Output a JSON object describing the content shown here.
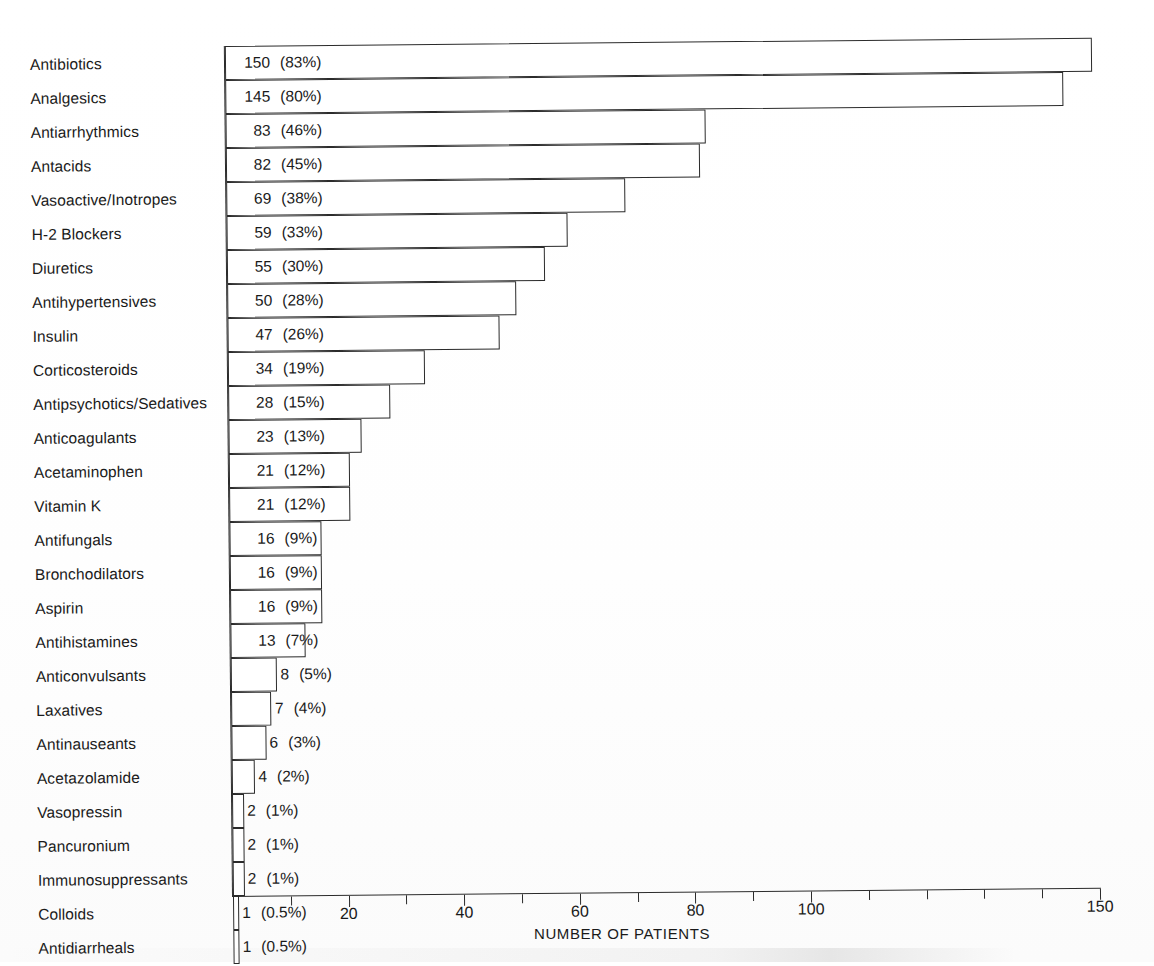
{
  "chart_data": {
    "type": "bar",
    "orientation": "horizontal",
    "title": "",
    "xlabel": "NUMBER OF PATIENTS",
    "ylabel": "",
    "xlim": [
      0,
      150
    ],
    "grid": false,
    "legend": null,
    "total_patients": 181,
    "xticks": [
      {
        "value": 20,
        "label": "20"
      },
      {
        "value": 40,
        "label": "40"
      },
      {
        "value": 60,
        "label": "60"
      },
      {
        "value": 80,
        "label": "80"
      },
      {
        "value": 100,
        "label": "100"
      },
      {
        "value": 150,
        "label": "150"
      }
    ],
    "minor_tick_interval": 10,
    "categories": [
      "Antibiotics",
      "Analgesics",
      "Antiarrhythmics",
      "Antacids",
      "Vasoactive/Inotropes",
      "H-2 Blockers",
      "Diuretics",
      "Antihypertensives",
      "Insulin",
      "Corticosteroids",
      "Antipsychotics/Sedatives",
      "Anticoagulants",
      "Acetaminophen",
      "Vitamin K",
      "Antifungals",
      "Bronchodilators",
      "Aspirin",
      "Antihistamines",
      "Anticonvulsants",
      "Laxatives",
      "Antinauseants",
      "Acetazolamide",
      "Vasopressin",
      "Pancuronium",
      "Immunosuppressants",
      "Colloids",
      "Antidiarrheals"
    ],
    "values": [
      150,
      145,
      83,
      82,
      69,
      59,
      55,
      50,
      47,
      34,
      28,
      23,
      21,
      21,
      16,
      16,
      16,
      13,
      8,
      7,
      6,
      4,
      2,
      2,
      2,
      1,
      1
    ],
    "percent_labels": [
      "(83%)",
      "(80%)",
      "(46%)",
      "(45%)",
      "(38%)",
      "(33%)",
      "(30%)",
      "(28%)",
      "(26%)",
      "(19%)",
      "(15%)",
      "(13%)",
      "(12%)",
      "(12%)",
      "(9%)",
      "(9%)",
      "(9%)",
      "(7%)",
      "(5%)",
      "(4%)",
      "(3%)",
      "(2%)",
      "(1%)",
      "(1%)",
      "(1%)",
      "(0.5%)",
      "(0.5%)"
    ],
    "value_labels": [
      "150",
      "145",
      "83",
      "82",
      "69",
      "59",
      "55",
      "50",
      "47",
      "34",
      "28",
      "23",
      "21",
      "21",
      "16",
      "16",
      "16",
      "13",
      "8",
      "7",
      "6",
      "4",
      "2",
      "2",
      "2",
      "1",
      "1"
    ],
    "colors": {
      "bar_fill": "#ffffff",
      "bar_stroke": "#2b2b2b",
      "text": "#1a1a1a",
      "background": "#ffffff"
    }
  }
}
